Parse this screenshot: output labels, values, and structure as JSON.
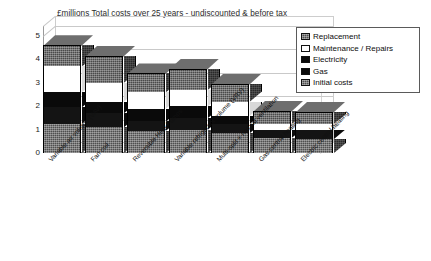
{
  "chart_data": {
    "type": "bar",
    "subtype": "stacked-3d-column",
    "title": "£millions Total costs over 25 years - undiscounted & before tax",
    "xlabel": "",
    "ylabel": "",
    "ylim": [
      0,
      5
    ],
    "yticks": [
      0,
      1,
      2,
      3,
      4,
      5
    ],
    "grid": true,
    "legend_position": "top-right",
    "categories": [
      "Variable air volume (VAV)",
      "Fan coil",
      "Reversible Heat Pumps",
      "Variable refrigerant volume (VRV)",
      "Multi-split + natural ventilation",
      "Gas central heating",
      "Electric central heating"
    ],
    "series": [
      {
        "name": "Initial costs",
        "color": "#4f4f4f",
        "values": [
          1.25,
          1.1,
          0.95,
          1.0,
          0.85,
          0.65,
          0.6
        ]
      },
      {
        "name": "Gas",
        "color": "#141414",
        "values": [
          0.7,
          0.6,
          0.4,
          0.5,
          0.4,
          0.35,
          0.4
        ]
      },
      {
        "name": "Electricity",
        "color": "#0a0a0a",
        "values": [
          0.65,
          0.5,
          0.55,
          0.5,
          0.35,
          0.0,
          0.0
        ]
      },
      {
        "name": "Maintenance / Repairs",
        "color": "#ffffff",
        "values": [
          1.1,
          0.8,
          0.7,
          0.7,
          0.6,
          0.25,
          0.25
        ]
      },
      {
        "name": "Replacement",
        "color": "#4a4a4a",
        "values": [
          0.9,
          1.15,
          0.8,
          0.9,
          0.75,
          0.55,
          0.5
        ]
      }
    ],
    "totals": [
      4.6,
      4.15,
      3.4,
      3.6,
      2.95,
      1.8,
      1.75
    ]
  },
  "legend": {
    "items": [
      {
        "label": "Replacement",
        "swatch": "hatched-gray"
      },
      {
        "label": "Maintenance / Repairs",
        "swatch": "white"
      },
      {
        "label": "Electricity",
        "swatch": "black"
      },
      {
        "label": "Gas",
        "swatch": "black"
      },
      {
        "label": "Initial costs",
        "swatch": "hatched-gray"
      }
    ]
  }
}
